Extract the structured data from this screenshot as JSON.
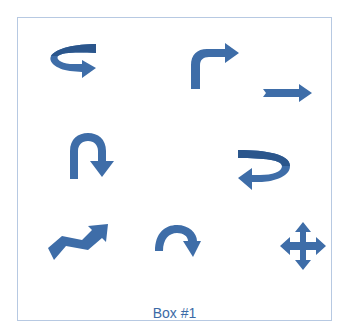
{
  "box": {
    "label": "Box #1",
    "border_color": "#b7c9e2",
    "arrow_color": "#3e6da8",
    "arrow_dark_color": "#2b568c"
  },
  "shapes": [
    {
      "name": "curved-right-arrow-icon",
      "row": 1,
      "col": 1
    },
    {
      "name": "bent-up-right-arrow-icon",
      "row": 1,
      "col": 2
    },
    {
      "name": "straight-right-arrow-icon",
      "row": 1,
      "col": 3
    },
    {
      "name": "u-turn-down-arrow-icon",
      "row": 2,
      "col": 1
    },
    {
      "name": "curved-left-arrow-icon",
      "row": 2,
      "col": 3
    },
    {
      "name": "zigzag-up-right-arrow-icon",
      "row": 3,
      "col": 1
    },
    {
      "name": "circular-clockwise-arrow-icon",
      "row": 3,
      "col": 2
    },
    {
      "name": "four-way-move-arrow-icon",
      "row": 3,
      "col": 3
    }
  ]
}
